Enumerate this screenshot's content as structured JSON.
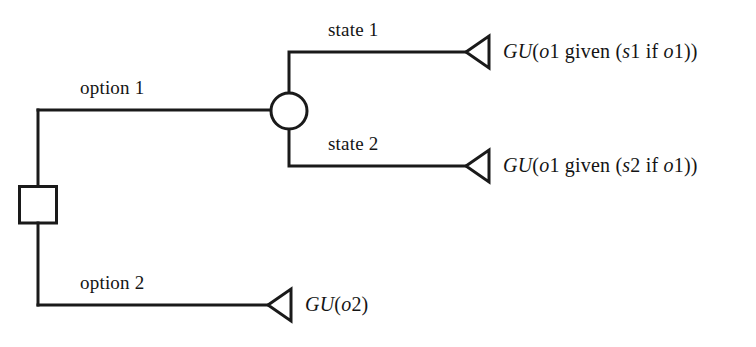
{
  "diagram": {
    "type": "decision-tree",
    "line_color": "#1a1a1a",
    "background_color": "#ffffff",
    "nodes": [
      {
        "id": "decision-node",
        "shape": "square",
        "label": "",
        "x": 38,
        "y": 204
      },
      {
        "id": "chance-node",
        "shape": "circle",
        "label": "",
        "x": 289,
        "y": 111
      }
    ],
    "branches": [
      {
        "id": "option-1",
        "label": "option 1",
        "from": "decision-node",
        "to": "chance-node"
      },
      {
        "id": "option-2",
        "label": "option 2",
        "from": "decision-node",
        "to": "terminal-3"
      },
      {
        "id": "state-1",
        "label": "state 1",
        "from": "chance-node",
        "to": "terminal-1"
      },
      {
        "id": "state-2",
        "label": "state 2",
        "from": "chance-node",
        "to": "terminal-2"
      }
    ],
    "terminals": [
      {
        "id": "terminal-1",
        "shape": "triangle",
        "payoff_parts": [
          {
            "text": "GU",
            "style": "italic"
          },
          {
            "text": "(",
            "style": "roman"
          },
          {
            "text": "o",
            "style": "italic"
          },
          {
            "text": "1 given (",
            "style": "roman"
          },
          {
            "text": "s",
            "style": "italic"
          },
          {
            "text": "1 if ",
            "style": "roman"
          },
          {
            "text": "o",
            "style": "italic"
          },
          {
            "text": "1))",
            "style": "roman"
          }
        ],
        "payoff_text": "GU(o1 given (s1 if o1))"
      },
      {
        "id": "terminal-2",
        "shape": "triangle",
        "payoff_parts": [
          {
            "text": "GU",
            "style": "italic"
          },
          {
            "text": "(",
            "style": "roman"
          },
          {
            "text": "o",
            "style": "italic"
          },
          {
            "text": "1 given (",
            "style": "roman"
          },
          {
            "text": "s",
            "style": "italic"
          },
          {
            "text": "2 if ",
            "style": "roman"
          },
          {
            "text": "o",
            "style": "italic"
          },
          {
            "text": "1))",
            "style": "roman"
          }
        ],
        "payoff_text": "GU(o1 given (s2 if o1))"
      },
      {
        "id": "terminal-3",
        "shape": "triangle",
        "payoff_parts": [
          {
            "text": "GU",
            "style": "italic"
          },
          {
            "text": "(",
            "style": "roman"
          },
          {
            "text": "o",
            "style": "italic"
          },
          {
            "text": "2)",
            "style": "roman"
          }
        ],
        "payoff_text": "GU(o2)"
      }
    ],
    "labels": {
      "option_1": "option 1",
      "option_2": "option 2",
      "state_1": "state 1",
      "state_2": "state 2"
    }
  }
}
